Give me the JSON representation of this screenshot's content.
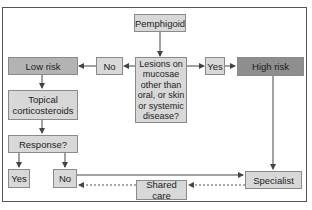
{
  "diagram": {
    "nodes": {
      "start": "Pemphigoid",
      "decision": "Lesions on\nmucosae\nother than\noral, or skin\nor systemic\ndisease?",
      "no_left": "No",
      "yes_right": "Yes",
      "low_risk": "Low risk",
      "high_risk": "High risk",
      "topical": "Topical\ncorticosteroids",
      "response": "Response?",
      "response_yes": "Yes",
      "response_no": "No",
      "specialist": "Specialist",
      "shared_care": "Shared care"
    },
    "edges": [
      {
        "from": "start",
        "to": "decision",
        "style": "solid"
      },
      {
        "from": "decision",
        "to": "no_left",
        "style": "solid"
      },
      {
        "from": "no_left",
        "to": "low_risk",
        "style": "solid"
      },
      {
        "from": "decision",
        "to": "yes_right",
        "style": "solid"
      },
      {
        "from": "yes_right",
        "to": "high_risk",
        "style": "solid"
      },
      {
        "from": "low_risk",
        "to": "topical",
        "style": "solid"
      },
      {
        "from": "topical",
        "to": "response",
        "style": "solid"
      },
      {
        "from": "response",
        "to": "response_yes",
        "style": "solid"
      },
      {
        "from": "response",
        "to": "response_no",
        "style": "solid"
      },
      {
        "from": "response_no",
        "to": "specialist",
        "style": "solid"
      },
      {
        "from": "high_risk",
        "to": "specialist",
        "style": "solid"
      },
      {
        "from": "specialist",
        "to": "shared_care",
        "style": "dashed"
      },
      {
        "from": "shared_care",
        "to": "response_no",
        "style": "dashed"
      }
    ],
    "colors": {
      "box_fill": "#d8d8d8",
      "low_risk_fill": "#b3b3b3",
      "high_risk_fill": "#8e8e8e",
      "border": "#8a8a8a",
      "line": "#444444"
    }
  }
}
